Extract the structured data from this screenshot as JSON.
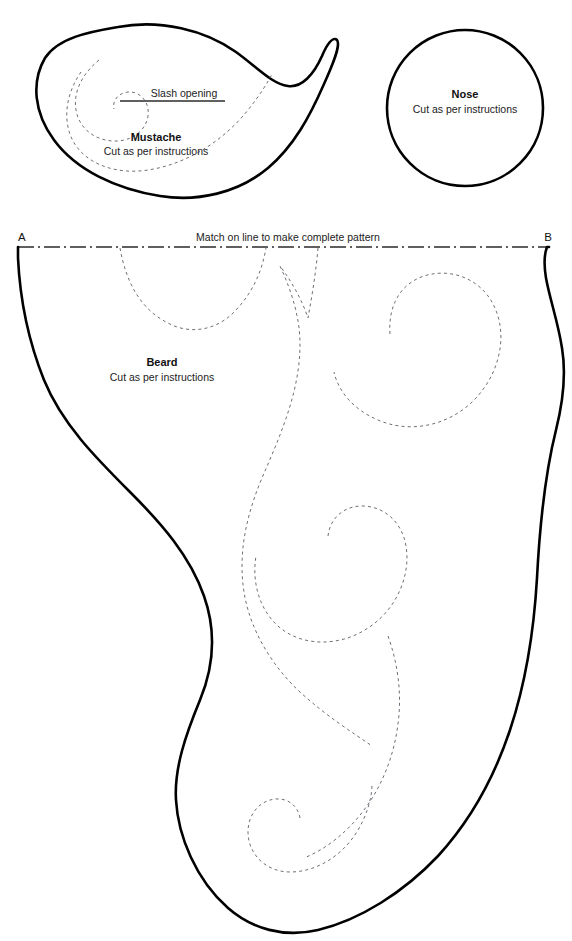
{
  "document": {
    "type": "sewing-pattern-sheet",
    "background_color": "#ffffff",
    "ink_color": "#000000",
    "stitch_color": "#6e6e78"
  },
  "pieces": {
    "mustache": {
      "title": "Mustache",
      "instruction": "Cut as per instructions",
      "slash_label": "Slash opening"
    },
    "nose": {
      "title": "Nose",
      "instruction": "Cut as per instructions"
    },
    "beard": {
      "title": "Beard",
      "instruction": "Cut as per instructions"
    }
  },
  "match_line": {
    "note": "Match on line to make complete pattern",
    "marker_left": "A",
    "marker_right": "B"
  }
}
